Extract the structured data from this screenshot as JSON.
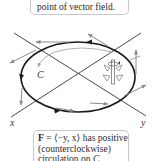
{
  "figure": {
    "top_callout": {
      "text": "point of vector field."
    },
    "bottom_callout": {
      "line1_bold": "F",
      "line1_rest": " = ⟨−y, x⟩ has positive",
      "line2": "(counterclockwise)",
      "line3_prefix": "circulation on ",
      "line3_curve": "C",
      "line3_suffix": "."
    },
    "labels": {
      "curve": "C",
      "x_axis": "x",
      "y_axis": "y"
    },
    "colors": {
      "curve": "#1a1a1a",
      "axes": "#333333",
      "vectors": "#8a8a8a",
      "inner_arrow": "#9a9a9a",
      "box_border": "#c8c8c8"
    },
    "vector_field": "F = ⟨−y, x⟩",
    "orientation": "counterclockwise"
  }
}
